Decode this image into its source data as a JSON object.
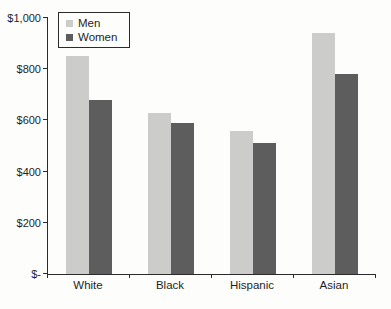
{
  "chart_data": {
    "type": "bar",
    "title": "",
    "xlabel": "",
    "ylabel": "",
    "categories": [
      "White",
      "Black",
      "Hispanic",
      "Asian"
    ],
    "series": [
      {
        "name": "Men",
        "color": "#cccccb",
        "values": [
          850,
          630,
          560,
          940
        ]
      },
      {
        "name": "Women",
        "color": "#5d5d5d",
        "values": [
          680,
          590,
          510,
          780
        ]
      }
    ],
    "ylim": [
      0,
      1000
    ],
    "ytick_interval": 200,
    "ytick_labels": [
      "$-",
      "$200",
      "$400",
      "$600",
      "$800",
      "$1,000"
    ],
    "grid": false,
    "legend_position": "top-left",
    "axis_color": "#2b2b2b",
    "background_color": "#fdfdfc"
  }
}
